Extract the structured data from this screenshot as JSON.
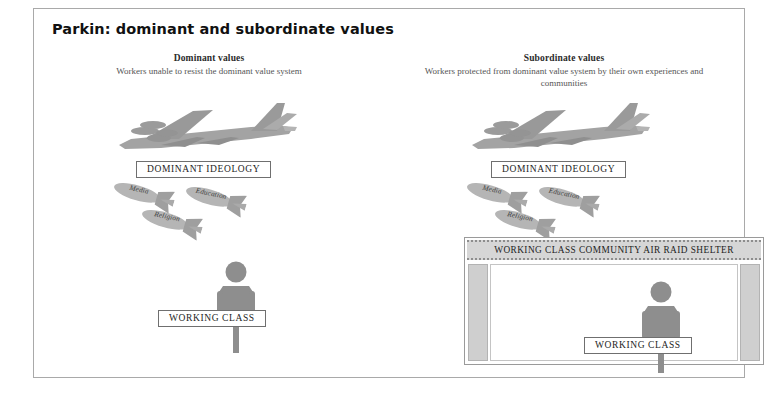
{
  "page": {
    "title": "Parkin: dominant and subordinate values"
  },
  "columns": {
    "dominant": {
      "heading": "Dominant values",
      "subtitle": "Workers unable to resist the dominant value system",
      "ideology_label": "DOMINANT IDEOLOGY",
      "working_class_label": "WORKING CLASS",
      "bombs": [
        {
          "label": "Media"
        },
        {
          "label": "Religion"
        },
        {
          "label": "Education"
        }
      ],
      "aircraft_icon": "bomber-aircraft-icon"
    },
    "subordinate": {
      "heading": "Subordinate values",
      "subtitle": "Workers protected from dominant value system by their own experiences and communities",
      "ideology_label": "DOMINANT IDEOLOGY",
      "working_class_label": "WORKING CLASS",
      "shelter_label": "WORKING CLASS COMMUNITY AIR RAID SHELTER",
      "bombs": [
        {
          "label": "Media"
        },
        {
          "label": "Religion"
        },
        {
          "label": "Education"
        }
      ],
      "aircraft_icon": "bomber-aircraft-icon"
    }
  },
  "colors": {
    "figure_gray": "#8e8e8e",
    "aircraft_gray": "#a0a0a0",
    "bomb_gray": "#b0b0b0",
    "frame_border": "#a9a9a9",
    "shelter_pillar": "#cfcfcf",
    "banner_fill": "#d6d6d6",
    "title_text": "#111111"
  }
}
